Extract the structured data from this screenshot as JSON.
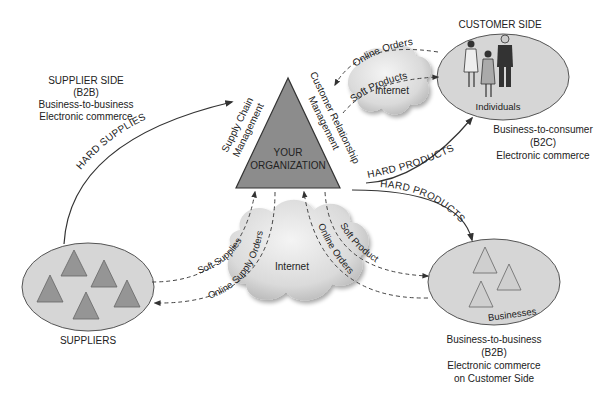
{
  "diagram": {
    "colors": {
      "ellipse_fill": "#d6d6d6",
      "ellipse_stroke": "#555555",
      "triangle_fill": "#8c8c8c",
      "small_triangle_fill": "#959595",
      "outline_triangle_fill": "#cfcfcf",
      "cloud_fill": "#e4e4e4",
      "line": "#333333"
    },
    "organization": {
      "line1": "YOUR",
      "line2": "ORGANIZATION",
      "left_label_1": "Supply Chain",
      "left_label_2": "Management",
      "right_label_1": "Customer Relationship",
      "right_label_2": "Management"
    },
    "supplier_side": {
      "title": "SUPPLIER SIDE",
      "line2": "(B2B)",
      "line3": "Business-to-business",
      "line4": "Electronic commerce"
    },
    "suppliers": {
      "label": "SUPPLIERS"
    },
    "customer_side": {
      "title": "CUSTOMER SIDE",
      "ellipse_label": "Individuals",
      "caption_1": "Business-to-consumer",
      "caption_2": "(B2C)",
      "caption_3": "Electronic commerce"
    },
    "businesses": {
      "ellipse_label": "Businesses",
      "caption_1": "Business-to-business",
      "caption_2": "(B2B)",
      "caption_3": "Electronic commerce",
      "caption_4": "on Customer Side"
    },
    "clouds": {
      "top": "Internet",
      "bottom": "Internet"
    },
    "flows": {
      "hard_supplies": "HARD SUPPLIES",
      "hard_products_b2c": "HARD PRODUCTS",
      "hard_products_b2b": "HARD PRODUCTS",
      "online_orders_top": "Online Orders",
      "soft_products_top": "Soft Products",
      "soft_supplies": "Soft Supplies",
      "online_supply_orders": "Online Supply Orders",
      "soft_products_bottom": "Soft Products",
      "online_orders_bottom": "Online Orders"
    }
  }
}
